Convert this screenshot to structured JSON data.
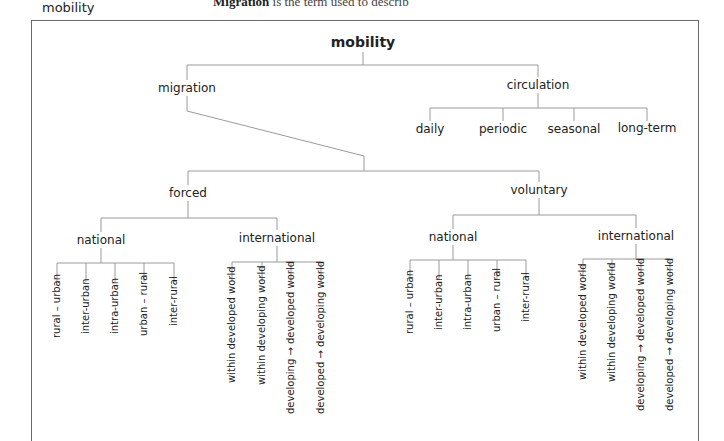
{
  "caption": "mobility",
  "background_heading": {
    "bold": "Migration",
    "rest": " is the term used to describ"
  },
  "diagram": {
    "root": "mobility",
    "migration": {
      "label": "migration",
      "forced": {
        "label": "forced",
        "national": {
          "label": "national",
          "children": [
            "rural – urban",
            "inter-urban",
            "intra-urban",
            "urban – rural",
            "inter-rural"
          ]
        },
        "international": {
          "label": "international",
          "children": [
            "within developed world",
            "within developing world",
            "developing → developed world",
            "developed → developing world"
          ]
        }
      },
      "voluntary": {
        "label": "voluntary",
        "national": {
          "label": "national",
          "children": [
            "rural – urban",
            "inter-urban",
            "intra-urban",
            "urban – rural",
            "inter-rural"
          ]
        },
        "international": {
          "label": "international",
          "children": [
            "within developed world",
            "within developing world",
            "developing → developed world",
            "developed → developing world"
          ]
        }
      }
    },
    "circulation": {
      "label": "circulation",
      "children": [
        "daily",
        "periodic",
        "seasonal",
        "long-term"
      ]
    }
  },
  "colors": {
    "line": "#9a9a9a",
    "frame": "#6a6a6a",
    "text": "#222222"
  }
}
